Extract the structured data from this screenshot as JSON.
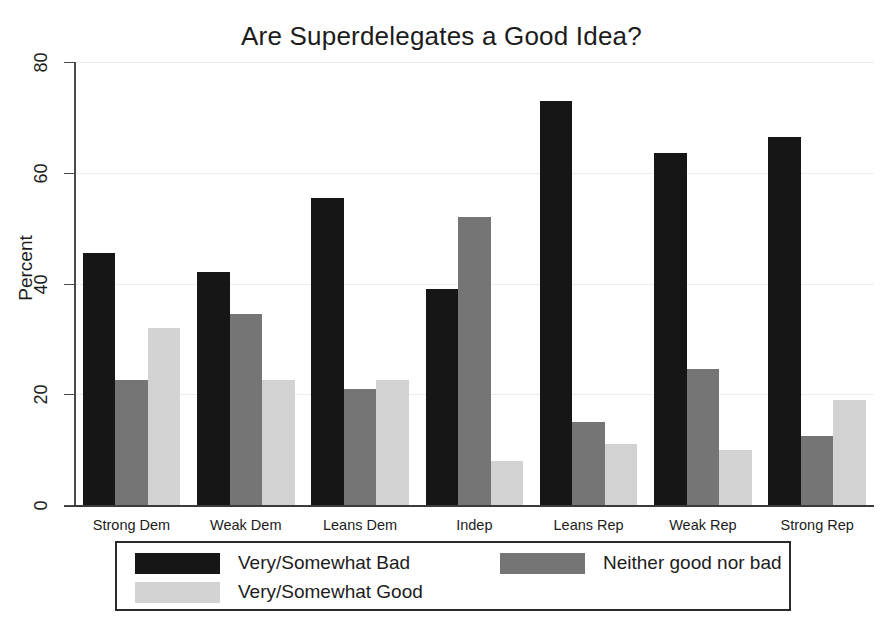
{
  "chart_data": {
    "type": "bar",
    "title": "Are Superdelegates a Good Idea?",
    "xlabel": "",
    "ylabel": "Percent",
    "ylim": [
      0,
      80
    ],
    "yticks": [
      "0",
      "20",
      "40",
      "60",
      "80"
    ],
    "grid": true,
    "legend_position": "bottom",
    "categories": [
      "Strong Dem",
      "Weak Dem",
      "Leans Dem",
      "Indep",
      "Leans Rep",
      "Weak Rep",
      "Strong Rep"
    ],
    "series": [
      {
        "name": "Very/Somewhat Bad",
        "color": "#161616",
        "values": [
          45.5,
          42.0,
          55.5,
          39.0,
          73.0,
          63.5,
          66.5
        ]
      },
      {
        "name": "Neither good nor bad",
        "color": "#757575",
        "values": [
          22.5,
          34.5,
          21.0,
          52.0,
          15.0,
          24.5,
          12.5
        ]
      },
      {
        "name": "Very/Somewhat Good",
        "color": "#d2d2d2",
        "values": [
          32.0,
          22.5,
          22.5,
          8.0,
          11.0,
          10.0,
          19.0
        ]
      }
    ]
  },
  "legend": {
    "entries": [
      {
        "label": "Very/Somewhat Bad"
      },
      {
        "label": "Neither good nor bad"
      },
      {
        "label": "Very/Somewhat Good"
      }
    ]
  }
}
